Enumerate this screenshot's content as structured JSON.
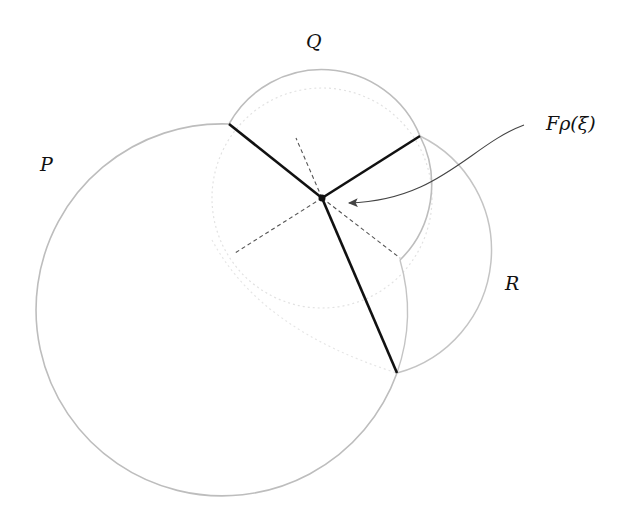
{
  "diagram": {
    "labels": {
      "P": "P",
      "Q": "Q",
      "R": "R",
      "annotation": "Fρ(ξ)"
    },
    "colors": {
      "circle_stroke": "#bdbdbd",
      "faint_circle": "#e0e0e0",
      "edge": "#111111",
      "dashed": "#555555",
      "arrow": "#444444"
    },
    "points": {
      "center": [
        322,
        198
      ],
      "vertex_upper_left": [
        229,
        124
      ],
      "vertex_upper_right": [
        420,
        136
      ],
      "vertex_bottom": [
        397,
        373
      ],
      "cusp_right": [
        400,
        260
      ]
    }
  }
}
